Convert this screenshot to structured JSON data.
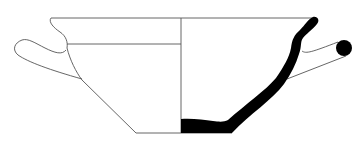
{
  "figure": {
    "type": "pottery-profile-drawing",
    "description": "Section and elevation drawing of a two-handled cup (kylix/skyphos type) with horizontal loop handles",
    "colors": {
      "background": "#ffffff",
      "outline": "#555555",
      "section_fill": "#000000"
    },
    "parts": {
      "left_half": "exterior elevation with handle loop",
      "right_half": "cross-section profile (solid black) with handle section",
      "center_axis": "vertical division line"
    }
  }
}
